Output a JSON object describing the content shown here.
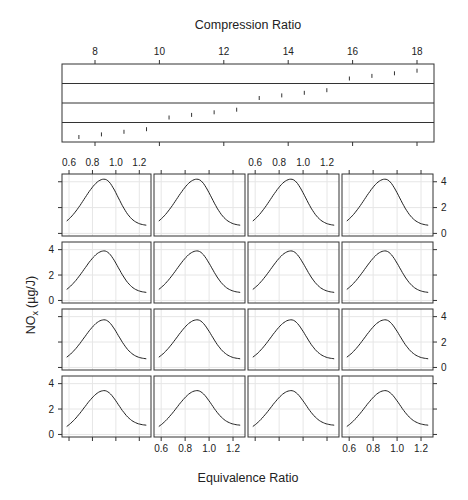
{
  "chart_data": {
    "type": "line",
    "layout": "trellis",
    "title": "Compression Ratio",
    "xlabel": "Equivalence Ratio",
    "ylabel": "NOx (µg/J)",
    "ylabel_main": "NO",
    "ylabel_sub": "x",
    "ylabel_unit": "(µg/J)",
    "strip_panel": {
      "title": "Compression Ratio",
      "xlim": [
        7.0,
        18.5
      ],
      "x_ticks": [
        8,
        10,
        12,
        14,
        16,
        18
      ],
      "rows": 4,
      "points": [
        7.5,
        8.2,
        8.9,
        9.6,
        10.3,
        11.0,
        11.7,
        12.4,
        13.1,
        13.8,
        14.5,
        15.2,
        15.9,
        16.6,
        17.3,
        18.0
      ]
    },
    "panel_grid": {
      "rows": 4,
      "cols": 4,
      "xlim": [
        0.54,
        1.3
      ],
      "ylim": [
        -0.2,
        4.6
      ],
      "x_ticks": [
        0.6,
        0.8,
        1.0,
        1.2
      ],
      "y_ticks": [
        0,
        2,
        4
      ],
      "grid": true
    },
    "series": [
      {
        "name": "Row 1 (top)",
        "peak_x": 0.9,
        "peak_y": 4.2,
        "left_y": 0.3,
        "right_y": 0.6
      },
      {
        "name": "Row 2",
        "peak_x": 0.9,
        "peak_y": 3.9,
        "left_y": 0.25,
        "right_y": 0.6
      },
      {
        "name": "Row 3",
        "peak_x": 0.9,
        "peak_y": 3.75,
        "left_y": 0.2,
        "right_y": 0.65
      },
      {
        "name": "Row 4 (bottom)",
        "peak_x": 0.9,
        "peak_y": 3.45,
        "left_y": 0.05,
        "right_y": 0.7
      }
    ]
  },
  "colors": {
    "frame": "#333333",
    "curve": "#222222",
    "grid": "#e6e6e6",
    "text": "#222222"
  }
}
